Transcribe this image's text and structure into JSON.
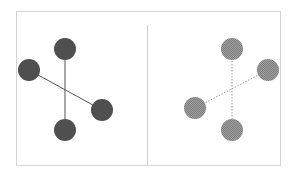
{
  "diagram": {
    "colors": {
      "background": "#ffffff",
      "frame_border": "#d4d4d4",
      "divider": "#cfcfcf",
      "left_node_fill": "#4f4f4f",
      "left_edge": "#555555",
      "right_node_fill": "#a0a0a0",
      "right_node_pattern": "#7d7d7d",
      "right_edge": "#9a9a9a"
    },
    "frame": {
      "x": 16,
      "y": 11,
      "width": 264,
      "height": 154
    },
    "divider": {
      "x": 147,
      "y1": 25,
      "y2": 165
    },
    "panels": [
      {
        "name": "left",
        "edge_style": "solid",
        "node_radius": 11,
        "nodes": [
          {
            "id": "top",
            "cx": 65,
            "cy": 49
          },
          {
            "id": "left",
            "cx": 29,
            "cy": 70
          },
          {
            "id": "right",
            "cx": 102,
            "cy": 110
          },
          {
            "id": "bottom",
            "cx": 65,
            "cy": 130
          }
        ],
        "edges": [
          {
            "from": "top",
            "to": "bottom"
          },
          {
            "from": "left",
            "to": "right"
          }
        ]
      },
      {
        "name": "right",
        "edge_style": "dotted",
        "node_radius": 11,
        "nodes": [
          {
            "id": "top",
            "cx": 232,
            "cy": 49
          },
          {
            "id": "right",
            "cx": 268,
            "cy": 70
          },
          {
            "id": "left",
            "cx": 195,
            "cy": 108
          },
          {
            "id": "bottom",
            "cx": 232,
            "cy": 130
          }
        ],
        "edges": [
          {
            "from": "top",
            "to": "bottom"
          },
          {
            "from": "right",
            "to": "left"
          }
        ]
      }
    ]
  }
}
